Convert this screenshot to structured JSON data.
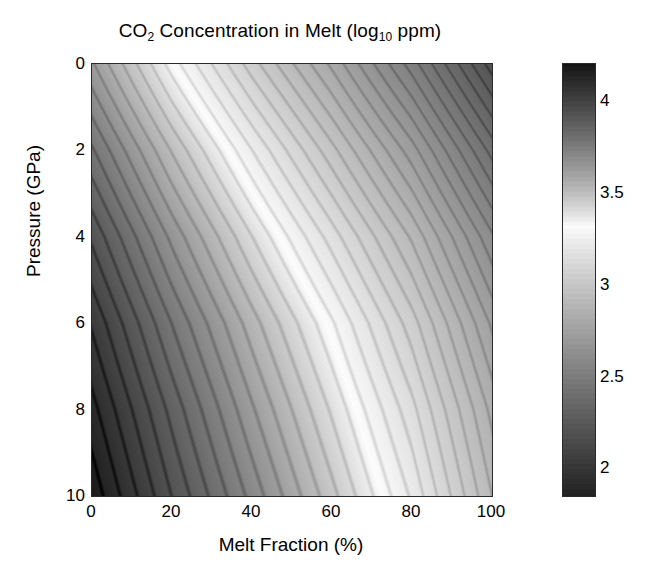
{
  "chart_data": {
    "type": "heatmap",
    "title": "CO2 Concentration in Melt (log10 ppm)",
    "title_parts": {
      "lead": "CO",
      "sub1": "2",
      "mid": " Concentration in Melt (log",
      "sub2": "10",
      "tail": " ppm)"
    },
    "xlabel": "Melt Fraction (%)",
    "ylabel": "Pressure (GPa)",
    "xlim": [
      0,
      100
    ],
    "ylim": [
      0,
      10
    ],
    "y_inverted": true,
    "grid": false,
    "xticks": [
      "0",
      "20",
      "40",
      "60",
      "80",
      "100"
    ],
    "xtick_values": [
      0,
      20,
      40,
      60,
      80,
      100
    ],
    "yticks": [
      "0",
      "2",
      "4",
      "6",
      "8",
      "10"
    ],
    "ytick_values": [
      0,
      2,
      4,
      6,
      8,
      10
    ],
    "colorbar": {
      "position": "right",
      "ticks": [
        "4",
        "3.5",
        "3",
        "2.5",
        "2"
      ],
      "tick_values": [
        4,
        3.5,
        3,
        2.5,
        2
      ],
      "vmin": 1.85,
      "vmax": 4.2,
      "inverted": true,
      "colormap": "grayscale-nonmonotonic",
      "bright_center_value": 3.32,
      "note": "dark at both high and low ends, white band near 3.3"
    },
    "value_range": [
      1.85,
      4.2
    ],
    "banding": {
      "present": true,
      "orientation": "diagonal-lower-left-to-upper-right",
      "bands": 44
    },
    "corner_values": {
      "top_left": 3.62,
      "top_right": 2.2,
      "bottom_left": 4.18,
      "bottom_right": 2.92
    },
    "samples": {
      "x": [
        0,
        20,
        40,
        60,
        80,
        100
      ],
      "y": [
        0,
        2,
        4,
        6,
        8,
        10
      ],
      "z": [
        [
          3.62,
          3.32,
          3.05,
          2.8,
          2.52,
          2.2
        ],
        [
          3.78,
          3.5,
          3.24,
          2.99,
          2.73,
          2.42
        ],
        [
          3.92,
          3.65,
          3.4,
          3.16,
          2.91,
          2.61
        ],
        [
          4.03,
          3.77,
          3.53,
          3.3,
          3.05,
          2.75
        ],
        [
          4.11,
          3.86,
          3.62,
          3.39,
          3.15,
          2.85
        ],
        [
          4.18,
          3.93,
          3.7,
          3.47,
          3.23,
          2.92
        ]
      ]
    }
  },
  "colors": {
    "background": "#ffffff",
    "text": "#000000",
    "axis_line": "#2a2a2a"
  }
}
